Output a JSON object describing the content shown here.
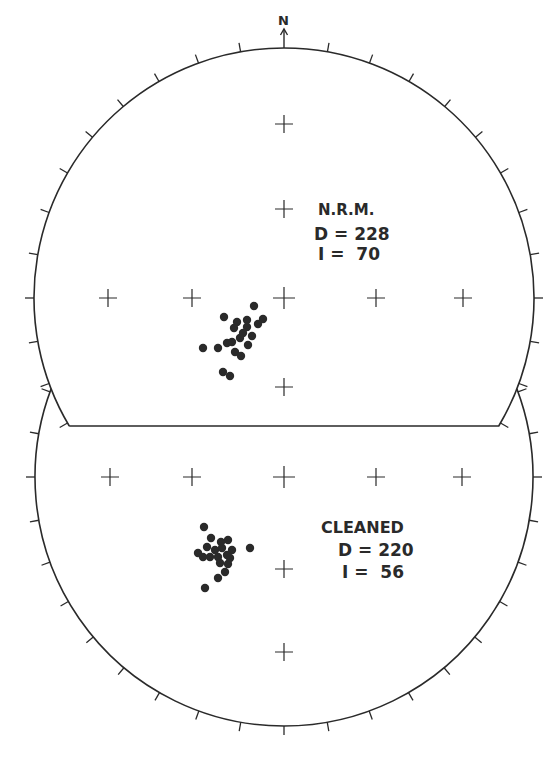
{
  "figure": {
    "north_label": "N",
    "colors": {
      "ink": "#2a2a2a",
      "background": "#ffffff"
    },
    "tick_interval_deg": 10
  },
  "upper_net": {
    "title": "N.R.M.",
    "declination_label": "D = 228",
    "inclination_label": "I =  70",
    "declination": 228,
    "inclination": 70
  },
  "lower_net": {
    "title": "CLEANED",
    "declination_label": "D = 220",
    "inclination_label": "I =  56",
    "declination": 220,
    "inclination": 56
  },
  "chart_data": {
    "type": "scatter",
    "panels": [
      {
        "name": "N.R.M.",
        "mean_declination": 228,
        "mean_inclination": 70,
        "center_px": [
          284,
          298
        ],
        "radius_px": 250,
        "grid_crosses_px": [
          [
            284,
            124
          ],
          [
            284,
            209
          ],
          [
            284,
            298
          ],
          [
            108,
            298
          ],
          [
            192,
            298
          ],
          [
            376,
            298
          ],
          [
            463,
            298
          ],
          [
            284,
            387
          ]
        ],
        "points_px": [
          [
            254,
            306
          ],
          [
            224,
            317
          ],
          [
            263,
            319
          ],
          [
            258,
            324
          ],
          [
            247,
            320
          ],
          [
            247,
            327
          ],
          [
            237,
            322
          ],
          [
            234,
            328
          ],
          [
            243,
            333
          ],
          [
            252,
            336
          ],
          [
            240,
            338
          ],
          [
            203,
            348
          ],
          [
            218,
            348
          ],
          [
            227,
            343
          ],
          [
            232,
            342
          ],
          [
            248,
            345
          ],
          [
            235,
            352
          ],
          [
            241,
            356
          ],
          [
            223,
            372
          ],
          [
            230,
            376
          ]
        ]
      },
      {
        "name": "CLEANED",
        "mean_declination": 220,
        "mean_inclination": 56,
        "center_px": [
          284,
          477
        ],
        "radius_px": 249,
        "grid_crosses_px": [
          [
            110,
            477
          ],
          [
            192,
            477
          ],
          [
            284,
            477
          ],
          [
            376,
            477
          ],
          [
            462,
            477
          ],
          [
            284,
            569
          ],
          [
            284,
            652
          ]
        ],
        "points_px": [
          [
            204,
            527
          ],
          [
            211,
            538
          ],
          [
            228,
            540
          ],
          [
            221,
            542
          ],
          [
            207,
            547
          ],
          [
            250,
            548
          ],
          [
            232,
            550
          ],
          [
            215,
            550
          ],
          [
            222,
            548
          ],
          [
            198,
            553
          ],
          [
            203,
            557
          ],
          [
            210,
            557
          ],
          [
            218,
            557
          ],
          [
            227,
            555
          ],
          [
            230,
            558
          ],
          [
            220,
            563
          ],
          [
            228,
            564
          ],
          [
            225,
            572
          ],
          [
            218,
            578
          ],
          [
            205,
            588
          ]
        ]
      }
    ],
    "xlabel": "",
    "ylabel": "",
    "legend": "none",
    "grid": false
  }
}
